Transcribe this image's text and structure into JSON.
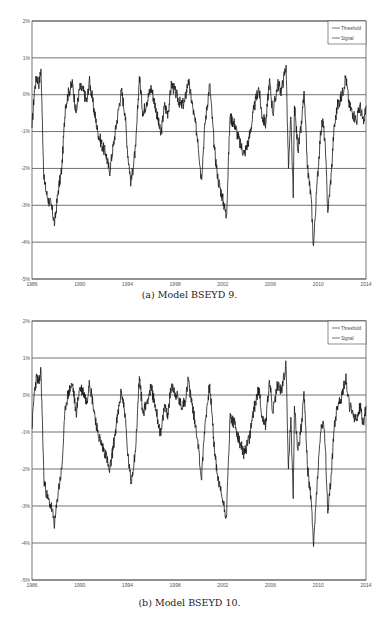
{
  "figure": {
    "panels": [
      {
        "id": "a",
        "caption": "(a) Model BSEYD 9."
      },
      {
        "id": "b",
        "caption": "(b) Model BSEYD 10."
      }
    ]
  },
  "chart_data": [
    {
      "type": "line",
      "title": "(a) Model BSEYD 9.",
      "xlabel": "",
      "ylabel": "",
      "xlim": [
        1986,
        2014
      ],
      "ylim": [
        -5,
        2
      ],
      "x_ticks": [
        "1986",
        "1990",
        "1994",
        "1998",
        "2002",
        "2006",
        "2010",
        "2014"
      ],
      "y_ticks": [
        "2%",
        "1%",
        "0%",
        "-1%",
        "-2%",
        "-3%",
        "-4%",
        "-5%"
      ],
      "grid": "horizontal",
      "legend": {
        "position": "top-right",
        "entries": [
          "Threshold",
          "Signal"
        ]
      },
      "series": [
        {
          "name": "Threshold",
          "values": [
            0,
            0
          ],
          "x": [
            1986,
            2014
          ]
        },
        {
          "name": "Signal",
          "x": [
            1986.0,
            1986.2,
            1986.4,
            1986.6,
            1986.75,
            1986.85,
            1987.0,
            1987.3,
            1987.6,
            1987.9,
            1988.2,
            1988.5,
            1988.8,
            1989.1,
            1989.4,
            1989.7,
            1990.0,
            1990.3,
            1990.6,
            1990.8,
            1991.1,
            1991.5,
            1991.9,
            1992.2,
            1992.5,
            1992.9,
            1993.3,
            1993.5,
            1993.8,
            1994.0,
            1994.3,
            1994.7,
            1995.0,
            1995.3,
            1995.6,
            1996.0,
            1996.4,
            1996.8,
            1997.1,
            1997.4,
            1997.7,
            1998.1,
            1998.5,
            1998.8,
            1999.1,
            1999.5,
            1999.9,
            2000.2,
            2000.5,
            2000.9,
            2001.3,
            2001.6,
            2001.9,
            2002.3,
            2002.6,
            2003.0,
            2003.4,
            2003.8,
            2004.2,
            2004.6,
            2005.0,
            2005.3,
            2005.6,
            2005.9,
            2006.2,
            2006.6,
            2006.9,
            2007.3,
            2007.5,
            2007.7,
            2007.9,
            2008.0,
            2008.3,
            2008.6,
            2008.8,
            2009.1,
            2009.4,
            2009.6,
            2009.9,
            2010.2,
            2010.4,
            2010.6,
            2010.8,
            2011.1,
            2011.3,
            2011.6,
            2012.0,
            2012.3,
            2012.6,
            2012.9,
            2013.2,
            2013.5,
            2013.8,
            2014.0
          ],
          "values": [
            -0.9,
            0.1,
            0.5,
            0.3,
            0.7,
            -0.5,
            -2.3,
            -2.8,
            -3.0,
            -3.5,
            -2.6,
            -2.0,
            -0.3,
            0.1,
            0.3,
            -0.5,
            0.2,
            0.1,
            -0.2,
            0.4,
            -0.2,
            -1.0,
            -1.4,
            -1.6,
            -2.1,
            -1.2,
            -0.3,
            0.1,
            -0.5,
            -1.5,
            -2.4,
            -1.4,
            0.5,
            -0.5,
            -0.2,
            0.2,
            -0.4,
            -1.1,
            -0.3,
            -0.5,
            0.3,
            0.0,
            -0.3,
            -0.2,
            0.4,
            -0.4,
            -1.2,
            -2.3,
            -0.8,
            0.3,
            -1.5,
            -2.3,
            -2.7,
            -3.3,
            -0.6,
            -0.8,
            -1.3,
            -1.6,
            -1.2,
            -0.4,
            0.2,
            -0.6,
            -0.8,
            0.4,
            -0.5,
            0.3,
            0.1,
            0.8,
            -2.0,
            -0.6,
            -2.8,
            -0.3,
            -1.5,
            -0.8,
            0.1,
            -2.0,
            -2.8,
            -4.1,
            -2.4,
            -1.0,
            -0.7,
            -1.5,
            -3.2,
            -2.1,
            -1.0,
            -0.3,
            0.0,
            0.5,
            -0.3,
            -0.5,
            -0.7,
            -0.3,
            -0.8,
            -0.3
          ]
        }
      ]
    },
    {
      "type": "line",
      "title": "(b) Model BSEYD 10.",
      "xlabel": "",
      "ylabel": "",
      "xlim": [
        1986,
        2014
      ],
      "ylim": [
        -5,
        2
      ],
      "x_ticks": [
        "1986",
        "1990",
        "1994",
        "1998",
        "2002",
        "2006",
        "2010",
        "2014"
      ],
      "y_ticks": [
        "2%",
        "1%",
        "0%",
        "-1%",
        "-2%",
        "-3%",
        "-4%",
        "-5%"
      ],
      "grid": "horizontal",
      "legend": {
        "position": "top-right",
        "entries": [
          "Threshold",
          "Signal"
        ]
      },
      "series": [
        {
          "name": "Threshold",
          "values": [
            0,
            0
          ],
          "x": [
            1986,
            2014
          ]
        },
        {
          "name": "Signal",
          "x": [
            1986.0,
            1986.2,
            1986.4,
            1986.6,
            1986.75,
            1986.85,
            1987.0,
            1987.3,
            1987.6,
            1987.9,
            1988.2,
            1988.5,
            1988.8,
            1989.1,
            1989.4,
            1989.7,
            1990.0,
            1990.3,
            1990.6,
            1990.8,
            1991.1,
            1991.5,
            1991.9,
            1992.2,
            1992.5,
            1992.9,
            1993.3,
            1993.5,
            1993.8,
            1994.0,
            1994.3,
            1994.7,
            1995.0,
            1995.3,
            1995.6,
            1996.0,
            1996.4,
            1996.8,
            1997.1,
            1997.4,
            1997.7,
            1998.1,
            1998.5,
            1998.8,
            1999.1,
            1999.5,
            1999.9,
            2000.2,
            2000.5,
            2000.9,
            2001.3,
            2001.6,
            2001.9,
            2002.3,
            2002.6,
            2003.0,
            2003.4,
            2003.8,
            2004.2,
            2004.6,
            2005.0,
            2005.3,
            2005.6,
            2005.9,
            2006.2,
            2006.6,
            2006.9,
            2007.3,
            2007.5,
            2007.7,
            2007.9,
            2008.0,
            2008.3,
            2008.6,
            2008.8,
            2009.1,
            2009.4,
            2009.6,
            2009.9,
            2010.2,
            2010.4,
            2010.6,
            2010.8,
            2011.1,
            2011.3,
            2011.6,
            2012.0,
            2012.3,
            2012.6,
            2012.9,
            2013.2,
            2013.5,
            2013.8,
            2014.0
          ],
          "values": [
            -0.9,
            0.1,
            0.5,
            0.3,
            0.7,
            -0.5,
            -2.3,
            -2.8,
            -3.0,
            -3.5,
            -2.6,
            -2.0,
            -0.3,
            0.1,
            0.3,
            -0.5,
            0.2,
            0.1,
            -0.2,
            0.4,
            -0.2,
            -1.0,
            -1.4,
            -1.6,
            -2.1,
            -1.2,
            -0.3,
            0.1,
            -0.5,
            -1.5,
            -2.4,
            -1.4,
            0.5,
            -0.5,
            -0.2,
            0.2,
            -0.4,
            -1.1,
            -0.3,
            -0.5,
            0.3,
            0.0,
            -0.3,
            -0.2,
            0.4,
            -0.4,
            -1.2,
            -2.3,
            -0.8,
            0.3,
            -1.5,
            -2.3,
            -2.7,
            -3.3,
            -0.6,
            -0.8,
            -1.3,
            -1.6,
            -1.2,
            -0.4,
            0.2,
            -0.6,
            -0.8,
            0.4,
            -0.5,
            0.3,
            0.1,
            0.8,
            -2.0,
            -0.6,
            -2.8,
            -0.3,
            -1.5,
            -0.8,
            0.1,
            -2.0,
            -2.8,
            -4.1,
            -2.4,
            -1.0,
            -0.7,
            -1.5,
            -3.2,
            -2.1,
            -1.0,
            -0.3,
            0.0,
            0.5,
            -0.3,
            -0.5,
            -0.7,
            -0.3,
            -0.8,
            -0.3
          ]
        }
      ]
    }
  ],
  "colors": {
    "signal": "#1a1a1a",
    "grid": "#333333",
    "axis": "#555555",
    "legend_border": "#444444"
  }
}
